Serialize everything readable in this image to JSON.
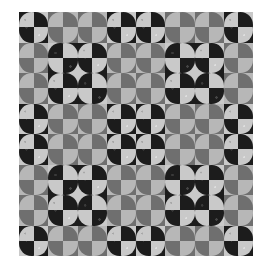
{
  "image": {
    "kind": "quilt-pattern",
    "description": "Grayscale quilt of quarter-circle (Robbing Peter to Pay Paul style) cells",
    "grid": {
      "cols": 16,
      "rows": 16
    },
    "block_repeat": {
      "cols": 2,
      "rows": 2,
      "block_cells": 8
    }
  },
  "fabrics": {
    "K": {
      "name": "dark-speckled",
      "color": "#1c1c1c"
    },
    "S": {
      "name": "light-speckled",
      "color": "#c9c9c9"
    },
    "G": {
      "name": "medium-gray",
      "color": "#6f6f6f"
    },
    "L": {
      "name": "light-gray",
      "color": "#b7b7b7"
    }
  },
  "block_circles": [
    [
      {
        "pair": [
          "S",
          "K"
        ]
      },
      {
        "pair": [
          "L",
          "G"
        ]
      },
      {
        "pair": [
          "L",
          "G"
        ]
      },
      {
        "pair": [
          "S",
          "K"
        ]
      }
    ],
    [
      {
        "pair": [
          "L",
          "G"
        ]
      },
      {
        "pair": [
          "K",
          "S"
        ]
      },
      {
        "pair": [
          "S",
          "K"
        ]
      },
      {
        "pair": [
          "L",
          "G"
        ]
      }
    ],
    [
      {
        "pair": [
          "L",
          "G"
        ]
      },
      {
        "pair": [
          "S",
          "K"
        ]
      },
      {
        "pair": [
          "K",
          "S"
        ]
      },
      {
        "pair": [
          "L",
          "G"
        ]
      }
    ],
    [
      {
        "pair": [
          "S",
          "K"
        ]
      },
      {
        "pair": [
          "L",
          "G"
        ]
      },
      {
        "pair": [
          "L",
          "G"
        ]
      },
      {
        "pair": [
          "S",
          "K"
        ]
      }
    ]
  ],
  "circle_rule": "pair[0] = color of TL and BR quarter-circles; pair[1] = color of TR and BL quarter-circles; each cell background is the opposite color of its quarter"
}
